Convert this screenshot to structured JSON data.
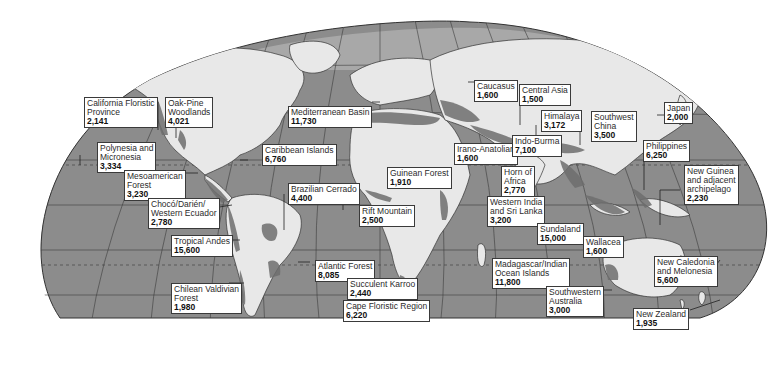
{
  "colors": {
    "ocean": "#8c8c8c",
    "land": "#e8e8e8",
    "hotspot": "#6e6e6e",
    "grid": "#3c3c3c",
    "label_bg": "#ffffff"
  },
  "hotspots": [
    {
      "name": "California Floristic Province",
      "lines": [
        "California Floristic",
        "Province"
      ],
      "value": "2,141"
    },
    {
      "name": "Oak-Pine Woodlands",
      "lines": [
        "Oak-Pine",
        "Woodlands"
      ],
      "value": "4,021"
    },
    {
      "name": "Polynesia and Micronesia",
      "lines": [
        "Polynesia and",
        "Micronesia"
      ],
      "value": "3,334"
    },
    {
      "name": "Mesoamerican Forest",
      "lines": [
        "Mesoamerican",
        "Forest"
      ],
      "value": "3,230"
    },
    {
      "name": "Chocó/Darién/Western Ecuador",
      "lines": [
        "Chocó/Darién/",
        "Western Ecuador"
      ],
      "value": "2,780"
    },
    {
      "name": "Tropical Andes",
      "lines": [
        "Tropical Andes"
      ],
      "value": "15,600"
    },
    {
      "name": "Chilean Valdivian Forest",
      "lines": [
        "Chilean Valdivian",
        "Forest"
      ],
      "value": "1,980"
    },
    {
      "name": "Mediterranean Basin",
      "lines": [
        "Mediterranean Basin"
      ],
      "value": "11,730"
    },
    {
      "name": "Caribbean Islands",
      "lines": [
        "Caribbean Islands"
      ],
      "value": "6,760"
    },
    {
      "name": "Brazilian Cerrado",
      "lines": [
        "Brazilian Cerrado"
      ],
      "value": "4,400"
    },
    {
      "name": "Guinean Forest",
      "lines": [
        "Guinean Forest"
      ],
      "value": "1,910"
    },
    {
      "name": "Rift Mountain",
      "lines": [
        "Rift Mountain"
      ],
      "value": "2,500"
    },
    {
      "name": "Atlantic Forest",
      "lines": [
        "Atlantic Forest"
      ],
      "value": "8,085"
    },
    {
      "name": "Succulent Karroo",
      "lines": [
        "Succulent Karroo"
      ],
      "value": "2,440"
    },
    {
      "name": "Cape Floristic Region",
      "lines": [
        "Cape Floristic Region"
      ],
      "value": "6,220"
    },
    {
      "name": "Caucasus",
      "lines": [
        "Caucasus"
      ],
      "value": "1,600"
    },
    {
      "name": "Central Asia",
      "lines": [
        "Central Asia"
      ],
      "value": "1,500"
    },
    {
      "name": "Irano-Anatolian",
      "lines": [
        "Irano-Anatolian"
      ],
      "value": "1,600"
    },
    {
      "name": "Himalaya",
      "lines": [
        "Himalaya"
      ],
      "value": "3,172"
    },
    {
      "name": "Indo-Burma",
      "lines": [
        "Indo-Burma"
      ],
      "value": "7,100"
    },
    {
      "name": "Southwest China",
      "lines": [
        "Southwest",
        "China"
      ],
      "value": "3,500"
    },
    {
      "name": "Japan",
      "lines": [
        "Japan"
      ],
      "value": "2,000"
    },
    {
      "name": "Philippines",
      "lines": [
        "Philippines"
      ],
      "value": "6,250"
    },
    {
      "name": "Horn of Africa",
      "lines": [
        "Horn of",
        "Africa"
      ],
      "value": "2,770"
    },
    {
      "name": "Western India and Sri Lanka",
      "lines": [
        "Western India",
        "and Sri Lanka"
      ],
      "value": "3,200"
    },
    {
      "name": "Sundaland",
      "lines": [
        "Sundaland"
      ],
      "value": "15,000"
    },
    {
      "name": "Wallacea",
      "lines": [
        "Wallacea"
      ],
      "value": "1,600"
    },
    {
      "name": "New Guinea and adjacent archipelago",
      "lines": [
        "New Guinea",
        "and adjacent",
        "archipelago"
      ],
      "value": "2,230"
    },
    {
      "name": "Madagascar/Indian Ocean Islands",
      "lines": [
        "Madagascar/Indian",
        "Ocean Islands"
      ],
      "value": "11,800"
    },
    {
      "name": "Southwestern Australia",
      "lines": [
        "Southwestern",
        "Australia"
      ],
      "value": "3,000"
    },
    {
      "name": "New Caledonia and Melonesia",
      "lines": [
        "New Caledonia",
        "and Melonesia"
      ],
      "value": "5,600"
    },
    {
      "name": "New Zealand",
      "lines": [
        "New Zealand"
      ],
      "value": "1,935"
    }
  ]
}
